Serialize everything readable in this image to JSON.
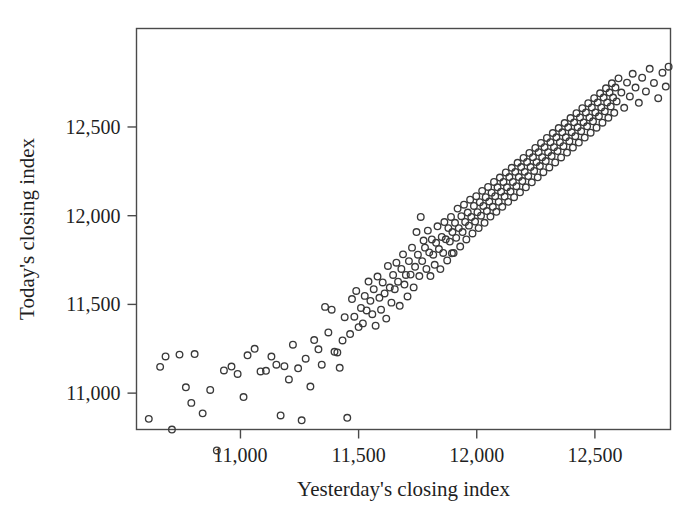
{
  "figure": {
    "background_color": "#ffffff",
    "frame_color": "#4a4a4a",
    "point_color": "#3a3a3a"
  },
  "chart_data": {
    "type": "scatter",
    "title": "",
    "xlabel": "Yesterday's closing index",
    "ylabel": "Today's closing index",
    "xticks": [
      "11,000",
      "11,500",
      "12,000",
      "12,500"
    ],
    "xtick_values": [
      11000,
      11500,
      12000,
      12500
    ],
    "yticks": [
      "11,000",
      "11,500",
      "12,000",
      "12,500"
    ],
    "ytick_values": [
      11000,
      11500,
      12000,
      12500
    ],
    "xlim": [
      10560,
      12820
    ],
    "ylim": [
      10795,
      13055
    ],
    "grid": false,
    "legend": null,
    "marker": "open-circle",
    "marker_size": 6.6,
    "n_points": 251,
    "series": [
      {
        "name": "Daily closing index pairs",
        "points": [
          [
            10612,
            10855
          ],
          [
            10660,
            11148
          ],
          [
            10683,
            11207
          ],
          [
            10710,
            10795
          ],
          [
            10742,
            11217
          ],
          [
            10769,
            11033
          ],
          [
            10792,
            10945
          ],
          [
            10806,
            11220
          ],
          [
            10840,
            10886
          ],
          [
            10872,
            11018
          ],
          [
            10900,
            10677
          ],
          [
            10930,
            11128
          ],
          [
            10962,
            11150
          ],
          [
            10988,
            11108
          ],
          [
            11013,
            10978
          ],
          [
            11030,
            11213
          ],
          [
            11060,
            11250
          ],
          [
            11085,
            11122
          ],
          [
            11108,
            11126
          ],
          [
            11131,
            11206
          ],
          [
            11152,
            11160
          ],
          [
            11170,
            10874
          ],
          [
            11186,
            11152
          ],
          [
            11205,
            11077
          ],
          [
            11222,
            11273
          ],
          [
            11244,
            11140
          ],
          [
            11259,
            10847
          ],
          [
            11276,
            11194
          ],
          [
            11296,
            11037
          ],
          [
            11312,
            11299
          ],
          [
            11330,
            11247
          ],
          [
            11344,
            11160
          ],
          [
            11358,
            11486
          ],
          [
            11372,
            11342
          ],
          [
            11386,
            11470
          ],
          [
            11398,
            11233
          ],
          [
            11410,
            11229
          ],
          [
            11420,
            11143
          ],
          [
            11432,
            11297
          ],
          [
            11441,
            11428
          ],
          [
            11452,
            10861
          ],
          [
            11464,
            11333
          ],
          [
            11472,
            11530
          ],
          [
            11482,
            11431
          ],
          [
            11490,
            11576
          ],
          [
            11500,
            11372
          ],
          [
            11510,
            11480
          ],
          [
            11518,
            11393
          ],
          [
            11526,
            11548
          ],
          [
            11534,
            11466
          ],
          [
            11542,
            11629
          ],
          [
            11550,
            11520
          ],
          [
            11558,
            11445
          ],
          [
            11564,
            11586
          ],
          [
            11572,
            11380
          ],
          [
            11580,
            11657
          ],
          [
            11588,
            11537
          ],
          [
            11595,
            11470
          ],
          [
            11602,
            11624
          ],
          [
            11610,
            11562
          ],
          [
            11617,
            11420
          ],
          [
            11624,
            11717
          ],
          [
            11632,
            11595
          ],
          [
            11639,
            11510
          ],
          [
            11646,
            11666
          ],
          [
            11653,
            11586
          ],
          [
            11660,
            11735
          ],
          [
            11667,
            11628
          ],
          [
            11674,
            11492
          ],
          [
            11681,
            11700
          ],
          [
            11688,
            11782
          ],
          [
            11694,
            11612
          ],
          [
            11700,
            11666
          ],
          [
            11707,
            11545
          ],
          [
            11713,
            11744
          ],
          [
            11720,
            11668
          ],
          [
            11726,
            11820
          ],
          [
            11733,
            11596
          ],
          [
            11739,
            11712
          ],
          [
            11745,
            11908
          ],
          [
            11751,
            11780
          ],
          [
            11757,
            11660
          ],
          [
            11763,
            11993
          ],
          [
            11769,
            11744
          ],
          [
            11775,
            11860
          ],
          [
            11781,
            11820
          ],
          [
            11787,
            11700
          ],
          [
            11793,
            11916
          ],
          [
            11799,
            11793
          ],
          [
            11804,
            11660
          ],
          [
            11810,
            11866
          ],
          [
            11816,
            11780
          ],
          [
            11822,
            11723
          ],
          [
            11828,
            11847
          ],
          [
            11834,
            11940
          ],
          [
            11840,
            11812
          ],
          [
            11846,
            11699
          ],
          [
            11852,
            11880
          ],
          [
            11858,
            11790
          ],
          [
            11863,
            11964
          ],
          [
            11869,
            11867
          ],
          [
            11875,
            11748
          ],
          [
            11880,
            11930
          ],
          [
            11886,
            11854
          ],
          [
            11891,
            11993
          ],
          [
            11897,
            11908
          ],
          [
            11902,
            11790
          ],
          [
            11908,
            11960
          ],
          [
            11913,
            11875
          ],
          [
            11919,
            12040
          ],
          [
            11924,
            11930
          ],
          [
            11930,
            11826
          ],
          [
            11935,
            11997
          ],
          [
            11940,
            11908
          ],
          [
            11946,
            12062
          ],
          [
            11951,
            11965
          ],
          [
            11956,
            11866
          ],
          [
            11962,
            12018
          ],
          [
            11967,
            11944
          ],
          [
            11972,
            12090
          ],
          [
            11977,
            11993
          ],
          [
            11982,
            11900
          ],
          [
            11988,
            12055
          ],
          [
            11993,
            11967
          ],
          [
            11998,
            12110
          ],
          [
            12003,
            12020
          ],
          [
            12008,
            11930
          ],
          [
            12013,
            12076
          ],
          [
            12018,
            12000
          ],
          [
            12023,
            12140
          ],
          [
            12028,
            12055
          ],
          [
            12033,
            11960
          ],
          [
            12038,
            12104
          ],
          [
            12043,
            12026
          ],
          [
            12048,
            12162
          ],
          [
            12053,
            12080
          ],
          [
            12058,
            11995
          ],
          [
            12063,
            12130
          ],
          [
            12068,
            12050
          ],
          [
            12073,
            12190
          ],
          [
            12078,
            12110
          ],
          [
            12083,
            12022
          ],
          [
            12088,
            12160
          ],
          [
            12093,
            12078
          ],
          [
            12098,
            12215
          ],
          [
            12103,
            12135
          ],
          [
            12108,
            12050
          ],
          [
            12113,
            12190
          ],
          [
            12118,
            12108
          ],
          [
            12123,
            12244
          ],
          [
            12128,
            12160
          ],
          [
            12133,
            12078
          ],
          [
            12138,
            12218
          ],
          [
            12143,
            12136
          ],
          [
            12148,
            12270
          ],
          [
            12153,
            12190
          ],
          [
            12158,
            12104
          ],
          [
            12163,
            12247
          ],
          [
            12168,
            12166
          ],
          [
            12173,
            12298
          ],
          [
            12178,
            12218
          ],
          [
            12183,
            12132
          ],
          [
            12188,
            12274
          ],
          [
            12193,
            12195
          ],
          [
            12198,
            12326
          ],
          [
            12203,
            12247
          ],
          [
            12208,
            12160
          ],
          [
            12213,
            12303
          ],
          [
            12218,
            12223
          ],
          [
            12223,
            12354
          ],
          [
            12228,
            12274
          ],
          [
            12233,
            12188
          ],
          [
            12238,
            12330
          ],
          [
            12243,
            12252
          ],
          [
            12248,
            12382
          ],
          [
            12253,
            12302
          ],
          [
            12258,
            12216
          ],
          [
            12262,
            12358
          ],
          [
            12267,
            12280
          ],
          [
            12272,
            12410
          ],
          [
            12277,
            12330
          ],
          [
            12282,
            12245
          ],
          [
            12287,
            12386
          ],
          [
            12292,
            12308
          ],
          [
            12297,
            12438
          ],
          [
            12302,
            12358
          ],
          [
            12307,
            12272
          ],
          [
            12312,
            12414
          ],
          [
            12317,
            12336
          ],
          [
            12322,
            12466
          ],
          [
            12327,
            12386
          ],
          [
            12332,
            12300
          ],
          [
            12337,
            12442
          ],
          [
            12342,
            12364
          ],
          [
            12347,
            12494
          ],
          [
            12352,
            12414
          ],
          [
            12357,
            12328
          ],
          [
            12362,
            12470
          ],
          [
            12367,
            12392
          ],
          [
            12372,
            12522
          ],
          [
            12377,
            12442
          ],
          [
            12382,
            12356
          ],
          [
            12387,
            12498
          ],
          [
            12392,
            12420
          ],
          [
            12397,
            12550
          ],
          [
            12402,
            12470
          ],
          [
            12407,
            12384
          ],
          [
            12412,
            12526
          ],
          [
            12417,
            12448
          ],
          [
            12422,
            12578
          ],
          [
            12427,
            12498
          ],
          [
            12432,
            12412
          ],
          [
            12437,
            12554
          ],
          [
            12442,
            12476
          ],
          [
            12447,
            12606
          ],
          [
            12452,
            12526
          ],
          [
            12457,
            12440
          ],
          [
            12462,
            12582
          ],
          [
            12467,
            12504
          ],
          [
            12472,
            12634
          ],
          [
            12477,
            12554
          ],
          [
            12482,
            12468
          ],
          [
            12487,
            12610
          ],
          [
            12492,
            12532
          ],
          [
            12497,
            12662
          ],
          [
            12502,
            12582
          ],
          [
            12507,
            12496
          ],
          [
            12512,
            12638
          ],
          [
            12517,
            12560
          ],
          [
            12522,
            12690
          ],
          [
            12527,
            12610
          ],
          [
            12532,
            12524
          ],
          [
            12537,
            12666
          ],
          [
            12542,
            12588
          ],
          [
            12547,
            12718
          ],
          [
            12552,
            12638
          ],
          [
            12557,
            12552
          ],
          [
            12562,
            12694
          ],
          [
            12567,
            12616
          ],
          [
            12572,
            12746
          ],
          [
            12577,
            12666
          ],
          [
            12582,
            12580
          ],
          [
            12587,
            12722
          ],
          [
            12592,
            12644
          ],
          [
            12600,
            12774
          ],
          [
            12612,
            12694
          ],
          [
            12624,
            12608
          ],
          [
            12636,
            12750
          ],
          [
            12648,
            12672
          ],
          [
            12660,
            12800
          ],
          [
            12672,
            12722
          ],
          [
            12686,
            12636
          ],
          [
            12700,
            12778
          ],
          [
            12716,
            12700
          ],
          [
            12732,
            12828
          ],
          [
            12750,
            12748
          ],
          [
            12768,
            12662
          ],
          [
            12786,
            12806
          ],
          [
            12800,
            12728
          ],
          [
            12812,
            12840
          ],
          [
            11895,
            11788
          ]
        ]
      }
    ]
  }
}
